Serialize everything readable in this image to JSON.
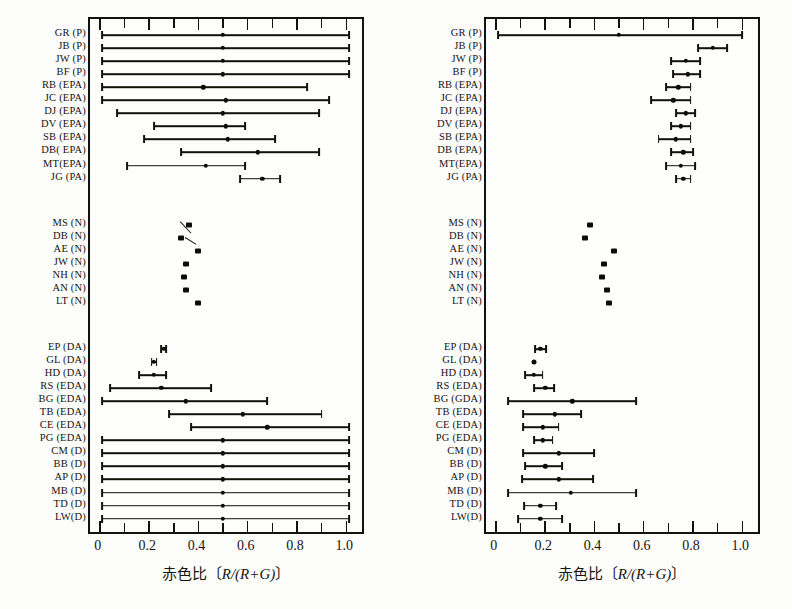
{
  "figure": {
    "axis_label": "赤色比〔R/(R+G)〕",
    "axis_label_prefix": "赤色比〔",
    "axis_label_math": "R/(R+G)",
    "axis_label_suffix": "〕",
    "tick_labels": [
      "0",
      "0.2",
      "0.4",
      "0.6",
      "0.8",
      "1.0"
    ],
    "tick_values": [
      0,
      0.2,
      0.4,
      0.6,
      0.8,
      1.0
    ],
    "minor_tick_values": [
      0.1,
      0.3,
      0.5,
      0.7,
      0.9
    ],
    "ink_color": "#131109",
    "frame_color": "#14120e"
  },
  "row_labels_left": [
    "GR (P)",
    "JB (P)",
    "JW (P)",
    "BF (P)",
    "RB (EPA)",
    "JC (EPA)",
    "DJ (EPA)",
    "DV (EPA)",
    "SB (EPA)",
    "DB( EPA)",
    "MT(EPA)",
    "JG (PA)",
    "MS (N)",
    "DB (N)",
    "AE (N)",
    "JW (N)",
    "NH (N)",
    "AN (N)",
    "LT (N)",
    "EP (DA)",
    "GL (DA)",
    "HD (DA)",
    "RS (EDA)",
    "BG (EDA)",
    "TB (EDA)",
    "CE (EDA)",
    "PG (EDA)",
    "CM (D)",
    "BB (D)",
    "AP (D)",
    "MB (D)",
    "TD (D)",
    "LW(D)"
  ],
  "row_labels_right": [
    "GR (P)",
    "JB (P)",
    "JW (P)",
    "BF (P)",
    "RB (EPA)",
    "JC (EPA)",
    "DJ (EPA)",
    "DV (EPA)",
    "SB (EPA)",
    "DB (EPA)",
    "MT(EPA)",
    "JG (PA)",
    "MS (N)",
    "DB (N)",
    "AE (N)",
    "JW (N)",
    "NH (N)",
    "AN (N)",
    "LT (N)",
    "EP (DA)",
    "GL (DA)",
    "HD (DA)",
    "RS (EDA)",
    "BG (GDA)",
    "TB (EDA)",
    "CE (EDA)",
    "PG (EDA)",
    "CM (D)",
    "BB (D)",
    "AP (D)",
    "MB (D)",
    "TD (D)",
    "LW(D)"
  ],
  "chart_data": [
    {
      "type": "scatter",
      "panel": "left",
      "title": "",
      "xlabel": "赤色比〔R/(R+G)〕",
      "ylabel": "",
      "xlim": [
        -0.04,
        1.08
      ],
      "grid": false,
      "legend": "none",
      "series": [
        {
          "name": "prior-interval",
          "categories": [
            "GR (P)",
            "JB (P)",
            "JW (P)",
            "BF (P)",
            "RB (EPA)",
            "JC (EPA)",
            "DJ (EPA)",
            "DV (EPA)",
            "SB (EPA)",
            "DB( EPA)",
            "MT(EPA)",
            "JG (PA)",
            "MS (N)",
            "DB (N)",
            "AE (N)",
            "JW (N)",
            "NH (N)",
            "AN (N)",
            "LT (N)",
            "EP (DA)",
            "GL (DA)",
            "HD (DA)",
            "RS (EDA)",
            "BG (EDA)",
            "TB (EDA)",
            "CE (EDA)",
            "PG (EDA)",
            "CM (D)",
            "BB (D)",
            "AP (D)",
            "MB (D)",
            "TD (D)",
            "LW(D)"
          ],
          "center": [
            0.5,
            0.5,
            0.5,
            0.5,
            0.42,
            0.51,
            0.5,
            0.51,
            0.52,
            0.64,
            0.43,
            0.66,
            0.36,
            0.33,
            0.4,
            0.35,
            0.34,
            0.35,
            0.4,
            0.26,
            0.22,
            0.22,
            0.25,
            0.35,
            0.58,
            0.68,
            0.5,
            0.5,
            0.5,
            0.5,
            0.5,
            0.5,
            0.5
          ],
          "low": [
            0.01,
            0.01,
            0.01,
            0.01,
            0.01,
            0.01,
            0.07,
            0.22,
            0.18,
            0.33,
            0.11,
            0.57,
            0.36,
            0.33,
            0.4,
            0.35,
            0.34,
            0.35,
            0.4,
            0.25,
            0.21,
            0.16,
            0.04,
            0.01,
            0.28,
            0.37,
            0.01,
            0.01,
            0.01,
            0.01,
            0.01,
            0.01,
            0.01
          ],
          "high": [
            1.01,
            1.01,
            1.01,
            1.01,
            0.84,
            0.93,
            0.89,
            0.59,
            0.71,
            0.89,
            0.59,
            0.73,
            0.36,
            0.33,
            0.4,
            0.35,
            0.34,
            0.35,
            0.4,
            0.27,
            0.23,
            0.27,
            0.45,
            0.68,
            0.9,
            1.01,
            1.01,
            1.01,
            1.01,
            1.01,
            1.01,
            1.01,
            1.01
          ]
        }
      ]
    },
    {
      "type": "scatter",
      "panel": "right",
      "title": "",
      "xlabel": "赤色比〔R/(R+G)〕",
      "ylabel": "",
      "xlim": [
        -0.04,
        1.08
      ],
      "grid": false,
      "legend": "none",
      "series": [
        {
          "name": "posterior-interval",
          "categories": [
            "GR (P)",
            "JB (P)",
            "JW (P)",
            "BF (P)",
            "RB (EPA)",
            "JC (EPA)",
            "DJ (EPA)",
            "DV (EPA)",
            "SB (EPA)",
            "DB (EPA)",
            "MT(EPA)",
            "JG (PA)",
            "MS (N)",
            "DB (N)",
            "AE (N)",
            "JW (N)",
            "NH (N)",
            "AN (N)",
            "LT (N)",
            "EP (DA)",
            "GL (DA)",
            "HD (DA)",
            "RS (EDA)",
            "BG (GDA)",
            "TB (EDA)",
            "CE (EDA)",
            "PG (EDA)",
            "CM (D)",
            "BB (D)",
            "AP (D)",
            "MB (D)",
            "TD (D)",
            "LW(D)"
          ],
          "center": [
            0.5,
            0.88,
            0.77,
            0.78,
            0.74,
            0.72,
            0.77,
            0.75,
            0.73,
            0.76,
            0.75,
            0.76,
            0.38,
            0.36,
            0.48,
            0.44,
            0.43,
            0.45,
            0.46,
            0.18,
            0.155,
            0.155,
            0.2,
            0.31,
            0.24,
            0.19,
            0.19,
            0.255,
            0.2,
            0.255,
            0.305,
            0.18,
            0.18
          ],
          "low": [
            0.01,
            0.82,
            0.71,
            0.72,
            0.69,
            0.63,
            0.73,
            0.71,
            0.66,
            0.71,
            0.69,
            0.73,
            0.38,
            0.36,
            0.48,
            0.44,
            0.43,
            0.45,
            0.46,
            0.16,
            0.155,
            0.12,
            0.155,
            0.05,
            0.11,
            0.11,
            0.155,
            0.11,
            0.12,
            0.105,
            0.05,
            0.115,
            0.09
          ],
          "high": [
            1.0,
            0.94,
            0.83,
            0.83,
            0.79,
            0.79,
            0.81,
            0.79,
            0.79,
            0.8,
            0.81,
            0.79,
            0.38,
            0.36,
            0.48,
            0.44,
            0.43,
            0.45,
            0.46,
            0.205,
            0.155,
            0.19,
            0.235,
            0.57,
            0.345,
            0.255,
            0.23,
            0.4,
            0.27,
            0.395,
            0.57,
            0.245,
            0.27
          ]
        }
      ]
    }
  ]
}
